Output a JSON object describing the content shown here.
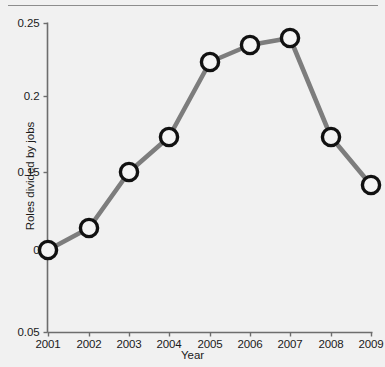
{
  "chart_data": {
    "type": "line",
    "title": "",
    "xlabel": "Year",
    "ylabel": "Roles divided by jobs",
    "categories": [
      "2001",
      "2002",
      "2003",
      "2004",
      "2005",
      "2006",
      "2007",
      "2008",
      "2009"
    ],
    "x": [
      2001,
      2002,
      2003,
      2004,
      2005,
      2006,
      2007,
      2008,
      2009
    ],
    "values": [
      0.0,
      0.015,
      0.15,
      0.172,
      0.222,
      0.233,
      0.237,
      0.171,
      0.142
    ],
    "series": [
      {
        "name": "Roles divided by jobs",
        "values": [
          0.0,
          0.015,
          0.15,
          0.172,
          0.222,
          0.233,
          0.237,
          0.171,
          0.142
        ]
      }
    ],
    "ytick_labels": [
      "0.25",
      "0.2",
      "0.15",
      "0",
      "0.05"
    ],
    "ytick_pixels": [
      23,
      96,
      172,
      250,
      332
    ],
    "xtick_labels": [
      "2001",
      "2002",
      "2003",
      "2004",
      "2005",
      "2006",
      "2007",
      "2008",
      "2009"
    ],
    "point_pixels": [
      {
        "label": "2001",
        "x": 48,
        "y": 250
      },
      {
        "label": "2002",
        "x": 89,
        "y": 228
      },
      {
        "label": "2003",
        "x": 129,
        "y": 172
      },
      {
        "label": "2004",
        "x": 169,
        "y": 137
      },
      {
        "label": "2005",
        "x": 210,
        "y": 62
      },
      {
        "label": "2006",
        "x": 250,
        "y": 45
      },
      {
        "label": "2007",
        "x": 290,
        "y": 38
      },
      {
        "label": "2008",
        "x": 331,
        "y": 137
      },
      {
        "label": "2009",
        "x": 371,
        "y": 185
      }
    ],
    "grid": false,
    "legend": "none",
    "marker": "open-circle",
    "colors": {
      "background": "#f1f1f1",
      "line": "#7d7d7d",
      "marker_stroke": "#111111",
      "marker_fill": "#f4f4f4",
      "axis": "#6d6d6d",
      "text": "#1a1a1a",
      "rule": "#8d8d8d"
    }
  }
}
